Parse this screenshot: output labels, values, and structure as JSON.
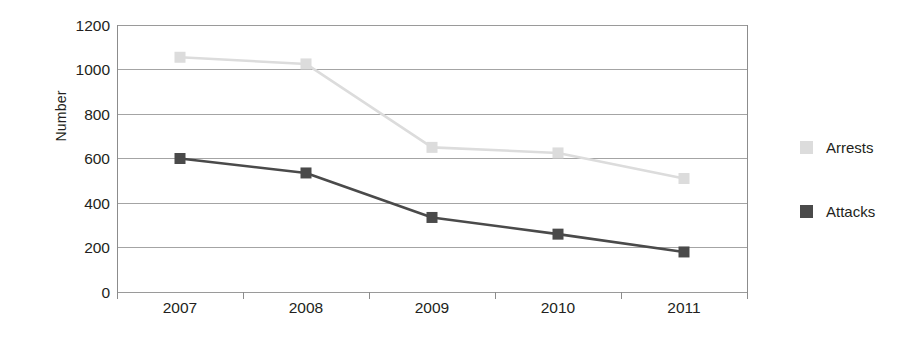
{
  "chart_data": {
    "type": "line",
    "title": "",
    "xlabel": "",
    "ylabel": "Number",
    "categories": [
      "2007",
      "2008",
      "2009",
      "2010",
      "2011"
    ],
    "ylim": [
      0,
      1200
    ],
    "ytick_step": 200,
    "yticks": [
      "1200",
      "1000",
      "800",
      "600",
      "400",
      "200",
      "0"
    ],
    "grid": true,
    "legend_position": "right",
    "series": [
      {
        "name": "Arrests",
        "color": "#dcdcdc",
        "marker": "square",
        "values": [
          1055,
          1025,
          650,
          625,
          510
        ]
      },
      {
        "name": "Attacks",
        "color": "#4a4a4a",
        "marker": "square",
        "values": [
          600,
          535,
          335,
          260,
          180
        ]
      }
    ]
  },
  "axis": {
    "y_title": "Number"
  },
  "colors": {
    "arrests": "#dcdcdc",
    "attacks": "#4a4a4a",
    "grid": "#9a9a9a",
    "frame": "#8c8c8c",
    "text": "#231f20",
    "background": "#ffffff"
  }
}
